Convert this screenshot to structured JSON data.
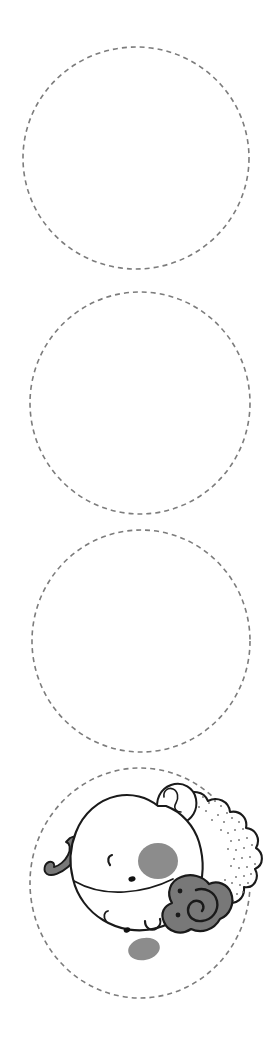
{
  "page": {
    "background_color": "#ffffff",
    "width": 273,
    "height": 1042
  },
  "colors": {
    "dash_stroke": "#7c7c7c",
    "ink_outline": "#1a1a1a",
    "fill_white": "#ffffff",
    "spot_gray": "#8c8c8c",
    "horn_gray": "#787878",
    "stipple_gray": "#7a7a7a",
    "nostril_black": "#111111"
  },
  "dash_style": {
    "stroke_width": 1.6,
    "dash_array": "5 4",
    "linecap": "butt"
  },
  "trace_circles": [
    {
      "name": "trace-circle-1",
      "label": "Circle 1",
      "cx": 136,
      "cy": 158,
      "rx": 113,
      "ry": 111,
      "has_illustration": false
    },
    {
      "name": "trace-circle-2",
      "label": "Circle 2",
      "cx": 140,
      "cy": 403,
      "rx": 110,
      "ry": 111,
      "has_illustration": false
    },
    {
      "name": "trace-circle-3",
      "label": "Circle 3",
      "cx": 141,
      "cy": 641,
      "rx": 109,
      "ry": 111,
      "has_illustration": false
    },
    {
      "name": "trace-circle-4",
      "label": "Circle 4",
      "cx": 140,
      "cy": 883,
      "rx": 110,
      "ry": 115,
      "has_illustration": true
    }
  ],
  "illustration": {
    "name": "sheep-face",
    "label": "Cartoon sheep face",
    "parts": [
      {
        "name": "sheep-tail-curl",
        "label": "Curled tail",
        "fill": "#787878"
      },
      {
        "name": "sheep-wool-scallops",
        "label": "Wool fleece scallops",
        "fill": "#ffffff"
      },
      {
        "name": "sheep-wool-stipple",
        "label": "Wool dotted texture",
        "fill": "#7a7a7a"
      },
      {
        "name": "sheep-head",
        "label": "Head",
        "fill": "#ffffff"
      },
      {
        "name": "sheep-ear",
        "label": "Ear",
        "fill": "#ffffff"
      },
      {
        "name": "sheep-horn",
        "label": "Spiral horn",
        "fill": "#787878"
      },
      {
        "name": "sheep-eye-upper",
        "label": "Upper closed eye",
        "fill": "#1a1a1a"
      },
      {
        "name": "sheep-eye-lower",
        "label": "Lower closed eye",
        "fill": "#1a1a1a"
      },
      {
        "name": "sheep-nostril-upper",
        "label": "Upper nostril",
        "fill": "#111111"
      },
      {
        "name": "sheep-nostril-lower",
        "label": "Lower nostril",
        "fill": "#111111"
      },
      {
        "name": "sheep-spot-large",
        "label": "Large gray spot",
        "fill": "#8c8c8c"
      },
      {
        "name": "sheep-spot-small",
        "label": "Small gray spot",
        "fill": "#8c8c8c"
      },
      {
        "name": "sheep-horn-dot-upper",
        "label": "Upper horn dot",
        "fill": "#1a1a1a"
      },
      {
        "name": "sheep-horn-dot-lower",
        "label": "Lower horn dot",
        "fill": "#1a1a1a"
      }
    ]
  }
}
